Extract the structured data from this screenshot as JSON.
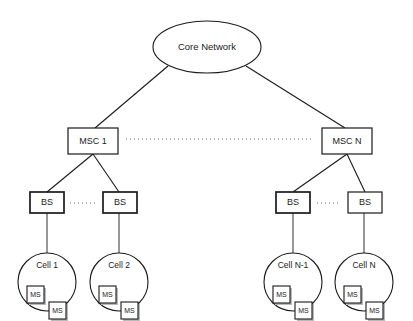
{
  "diagram": {
    "core": {
      "label": "Core Network",
      "shape": "ellipse",
      "cx": 207,
      "cy": 47,
      "rx": 54,
      "ry": 26
    },
    "msc_nodes": [
      {
        "id": "msc-1",
        "label": "MSC 1",
        "x": 68,
        "y": 128,
        "w": 50,
        "h": 26
      },
      {
        "id": "msc-n",
        "label": "MSC N",
        "x": 322,
        "y": 128,
        "w": 50,
        "h": 26
      }
    ],
    "bs_nodes": [
      {
        "id": "bs-1",
        "label": "BS",
        "x": 30,
        "y": 192,
        "w": 34,
        "h": 21,
        "heavy": true
      },
      {
        "id": "bs-2",
        "label": "BS",
        "x": 103,
        "y": 192,
        "w": 34,
        "h": 21,
        "heavy": true
      },
      {
        "id": "bs-3",
        "label": "BS",
        "x": 276,
        "y": 192,
        "w": 34,
        "h": 21,
        "heavy": true
      },
      {
        "id": "bs-4",
        "label": "BS",
        "x": 348,
        "y": 192,
        "w": 34,
        "h": 21,
        "heavy": false
      }
    ],
    "cell_nodes": [
      {
        "id": "cell-1",
        "label": "Cell 1",
        "cx": 47,
        "cy": 282,
        "r": 29
      },
      {
        "id": "cell-2",
        "label": "Cell 2",
        "cx": 119,
        "cy": 282,
        "r": 29
      },
      {
        "id": "cell-n-1",
        "label": "Cell N-1",
        "cx": 293,
        "cy": 282,
        "r": 29
      },
      {
        "id": "cell-n",
        "label": "Cell N",
        "cx": 364,
        "cy": 282,
        "r": 29
      }
    ],
    "ms_label": "MS",
    "ms_per_cell": 2,
    "ms_offsets": [
      {
        "dx": -20,
        "dy": 4
      },
      {
        "dx": 2,
        "dy": 20
      }
    ],
    "ms_size": 17,
    "dotted_connectors": [
      {
        "id": "msc-dotted-link",
        "x1": 126,
        "y1": 139,
        "x2": 314,
        "y2": 139
      },
      {
        "id": "bs-dotted-link-1",
        "x1": 70,
        "y1": 203,
        "x2": 96,
        "y2": 203
      },
      {
        "id": "bs-dotted-link-2",
        "x1": 317,
        "y1": 203,
        "x2": 341,
        "y2": 203
      }
    ],
    "edges": [
      {
        "id": "core-to-msc-1",
        "x1": 168,
        "y1": 66,
        "x2": 95,
        "y2": 128
      },
      {
        "id": "core-to-msc-n",
        "x1": 246,
        "y1": 66,
        "x2": 345,
        "y2": 128
      },
      {
        "id": "msc-1-to-bs-1",
        "x1": 93,
        "y1": 154,
        "x2": 47,
        "y2": 192
      },
      {
        "id": "msc-1-to-bs-2",
        "x1": 93,
        "y1": 154,
        "x2": 119,
        "y2": 192
      },
      {
        "id": "msc-n-to-bs-3",
        "x1": 347,
        "y1": 154,
        "x2": 293,
        "y2": 192
      },
      {
        "id": "msc-n-to-bs-4",
        "x1": 347,
        "y1": 154,
        "x2": 365,
        "y2": 192
      },
      {
        "id": "bs-1-to-cell-1",
        "x1": 47,
        "y1": 213,
        "x2": 47,
        "y2": 253
      },
      {
        "id": "bs-2-to-cell-2",
        "x1": 119,
        "y1": 213,
        "x2": 119,
        "y2": 253
      },
      {
        "id": "bs-3-to-cell-n-1",
        "x1": 293,
        "y1": 213,
        "x2": 293,
        "y2": 253
      },
      {
        "id": "bs-4-to-cell-n",
        "x1": 364,
        "y1": 213,
        "x2": 364,
        "y2": 253
      }
    ]
  }
}
